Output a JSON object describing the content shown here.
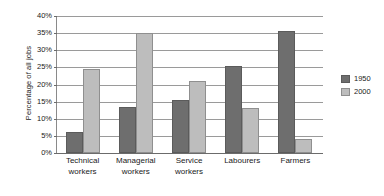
{
  "chart_data": {
    "type": "bar",
    "title": "",
    "subtitle": "",
    "xlabel": "",
    "ylabel": "Percentage of all jobs",
    "ylim": [
      0,
      40
    ],
    "ytick_step": 5,
    "ytick_labels": [
      "40%",
      "35%",
      "30%",
      "25%",
      "20%",
      "15%",
      "10%",
      "5%",
      "0%"
    ],
    "ytick_values": [
      40,
      35,
      30,
      25,
      20,
      15,
      10,
      5,
      0
    ],
    "grid": true,
    "legend_position": "right",
    "categories": [
      "Technical workers",
      "Managerial workers",
      "Service workers",
      "Labourers",
      "Farmers"
    ],
    "category_lines": [
      [
        "Technical",
        "workers"
      ],
      [
        "Managerial",
        "workers"
      ],
      [
        "Service",
        "workers"
      ],
      [
        "Labourers"
      ],
      [
        "Farmers"
      ]
    ],
    "series": [
      {
        "name": "1950",
        "color": "#6e6e6e",
        "values": [
          6,
          13.5,
          15.5,
          25.5,
          35.5
        ]
      },
      {
        "name": "2000",
        "color": "#bdbdbd",
        "values": [
          24.5,
          35,
          21,
          13,
          4
        ]
      }
    ]
  },
  "legend": {
    "items": [
      {
        "label": "1950",
        "swatch": "legend-swatch-1950"
      },
      {
        "label": "2000",
        "swatch": "legend-swatch-2000"
      }
    ]
  }
}
